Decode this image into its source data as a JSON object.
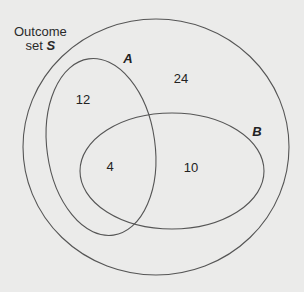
{
  "diagram": {
    "type": "venn",
    "universe": {
      "label_line1": "Outcome",
      "label_line2_prefix": "set ",
      "label_symbol": "S"
    },
    "sets": [
      {
        "name": "A",
        "label": "A"
      },
      {
        "name": "B",
        "label": "B"
      }
    ],
    "regions": {
      "A_only": "12",
      "A_and_B": "4",
      "B_only": "10",
      "neither": "24"
    },
    "colors": {
      "background": "#ebebea",
      "stroke": "#555555",
      "text": "#222222"
    }
  }
}
